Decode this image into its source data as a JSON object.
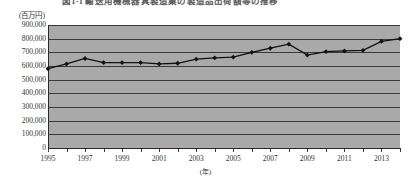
{
  "title": "図1-1  輸送用機械器具製造業の製造品出荷額等の推移",
  "chart_data": {
    "type": "line",
    "title": "",
    "xlabel": "(年)",
    "ylabel": "(百万円)",
    "y_unit_label": "(百万円)",
    "x_unit_label": "(年)",
    "ylim": [
      0,
      900000
    ],
    "ytick_step": 100000,
    "ytick_labels": [
      "900,000",
      "800,000",
      "700,000",
      "600,000",
      "500,000",
      "400,000",
      "300,000",
      "200,000",
      "100,000",
      "0"
    ],
    "ytick_values": [
      900000,
      800000,
      700000,
      600000,
      500000,
      400000,
      300000,
      200000,
      100000,
      0
    ],
    "xlim": [
      1995,
      2014
    ],
    "xtick_labels": [
      "1995",
      "1997",
      "1999",
      "2001",
      "2003",
      "2005",
      "2007",
      "2009",
      "2011",
      "2013"
    ],
    "xtick_values": [
      1995,
      1997,
      1999,
      2001,
      2003,
      2005,
      2007,
      2009,
      2011,
      2013
    ],
    "grid": true,
    "legend": false,
    "marker": "diamond",
    "line_color": "#111111",
    "plot_background": "#a9a9a9",
    "categories": [
      1995,
      1996,
      1997,
      1998,
      1999,
      2000,
      2001,
      2002,
      2003,
      2004,
      2005,
      2006,
      2007,
      2008,
      2009,
      2010,
      2011,
      2012,
      2013,
      2014
    ],
    "values": [
      580000,
      615000,
      655000,
      625000,
      625000,
      625000,
      615000,
      620000,
      650000,
      660000,
      665000,
      700000,
      730000,
      760000,
      680000,
      705000,
      710000,
      715000,
      780000,
      800000
    ]
  }
}
